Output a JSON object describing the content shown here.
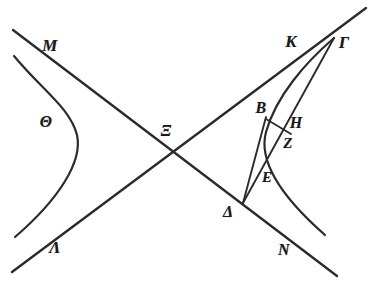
{
  "figure": {
    "background_color": "#ffffff",
    "ink_color": "#2b2b2b",
    "label_color": "#1a1a1a"
  },
  "labels": [
    {
      "id": "M",
      "text": "M",
      "x": 50,
      "y": 45,
      "size": 17
    },
    {
      "id": "Theta",
      "text": "Θ",
      "x": 46,
      "y": 122,
      "size": 16
    },
    {
      "id": "Lambda",
      "text": "Λ",
      "x": 55,
      "y": 247,
      "size": 17
    },
    {
      "id": "Xi",
      "text": "Ξ",
      "x": 166,
      "y": 131,
      "size": 16
    },
    {
      "id": "K",
      "text": "K",
      "x": 291,
      "y": 41,
      "size": 17
    },
    {
      "id": "Gamma",
      "text": "Γ",
      "x": 344,
      "y": 42,
      "size": 17
    },
    {
      "id": "B",
      "text": "B",
      "x": 261,
      "y": 108,
      "size": 16
    },
    {
      "id": "H",
      "text": "H",
      "x": 296,
      "y": 123,
      "size": 16
    },
    {
      "id": "Z",
      "text": "Z",
      "x": 288,
      "y": 143,
      "size": 15
    },
    {
      "id": "E",
      "text": "E",
      "x": 267,
      "y": 177,
      "size": 15
    },
    {
      "id": "Delta",
      "text": "Δ",
      "x": 228,
      "y": 212,
      "size": 16
    },
    {
      "id": "N",
      "text": "N",
      "x": 284,
      "y": 250,
      "size": 16
    }
  ],
  "strokes": [
    {
      "id": "asymptote-M-N",
      "kind": "line",
      "role": "asymptote through M down to N",
      "points": [
        [
          13,
          30
        ],
        [
          337,
          276
        ]
      ],
      "width": 2.4
    },
    {
      "id": "asymptote-Lambda-Gamma",
      "kind": "line",
      "role": "asymptote through Lambda up through K to Gamma",
      "points": [
        [
          12,
          272
        ],
        [
          366,
          8
        ]
      ],
      "width": 2.4
    },
    {
      "id": "hyperbola-left-branch",
      "kind": "curve",
      "role": "left hyperbola branch, vertex near Theta side",
      "path": "M 14 56 C 44 92, 70 108, 77 135 C 83 162, 58 200, 15 237",
      "width": 2.2
    },
    {
      "id": "hyperbola-right-branch",
      "kind": "curve",
      "role": "right hyperbola branch through B, vertex near E, down past N",
      "path": "M 334 38 C 306 62, 276 96, 266 132 C 259 158, 276 192, 325 235",
      "width": 2.2
    },
    {
      "id": "line-Delta-B",
      "kind": "line",
      "role": "chord from Delta up to B",
      "points": [
        [
          243,
          203
        ],
        [
          266,
          117
        ]
      ],
      "width": 1.9
    },
    {
      "id": "line-Delta-Gamma",
      "kind": "line",
      "role": "straight line from Delta through Z and H up to Gamma",
      "points": [
        [
          243,
          203
        ],
        [
          334,
          38
        ]
      ],
      "width": 1.9
    },
    {
      "id": "line-B-Z",
      "kind": "line",
      "role": "short transversal from B to Z on line Delta-Gamma",
      "points": [
        [
          266,
          119
        ],
        [
          291,
          134
        ]
      ],
      "width": 1.8
    }
  ]
}
